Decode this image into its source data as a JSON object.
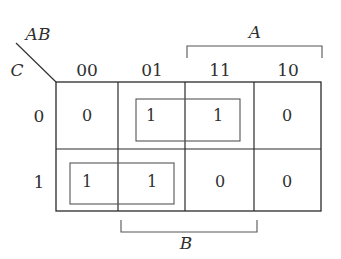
{
  "diagram": {
    "type": "karnaugh-map",
    "corner": {
      "row_var": "C",
      "col_var": "AB"
    },
    "column_headers": [
      "00",
      "01",
      "11",
      "10"
    ],
    "row_headers": [
      "0",
      "1"
    ],
    "cells": [
      [
        "0",
        "1",
        "1",
        "0"
      ],
      [
        "1",
        "1",
        "0",
        "0"
      ]
    ],
    "brackets": {
      "top": {
        "label": "A",
        "spans_columns": [
          "11",
          "10"
        ]
      },
      "bottom": {
        "label": "B",
        "spans_columns": [
          "01",
          "11"
        ]
      }
    },
    "groups": [
      {
        "row": "0",
        "columns": [
          "01",
          "11"
        ]
      },
      {
        "row": "1",
        "columns": [
          "00",
          "01"
        ]
      }
    ],
    "colors": {
      "line": "#2a2a2a",
      "group_box": "#555555",
      "text": "#2f2f2f"
    }
  }
}
